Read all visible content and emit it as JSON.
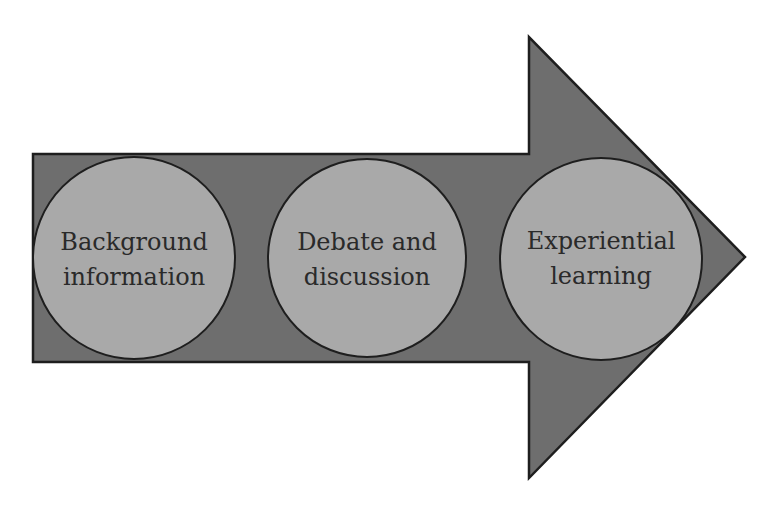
{
  "diagram": {
    "type": "process-arrow",
    "colors": {
      "background": "#ffffff",
      "arrow_fill": "#6e6e6e",
      "arrow_stroke": "#1e1e1e",
      "circle_fill": "#a9a9a9",
      "circle_stroke": "#1e1e1e",
      "text": "#2a2a2a"
    },
    "steps": [
      {
        "line1": "Background",
        "line2": "information"
      },
      {
        "line1": "Debate and",
        "line2": "discussion"
      },
      {
        "line1": "Experiential",
        "line2": "learning"
      }
    ]
  }
}
